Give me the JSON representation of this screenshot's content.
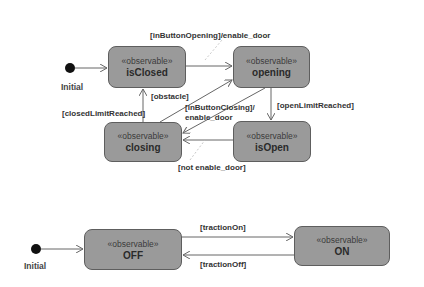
{
  "diagram": {
    "type": "uml-state-machine",
    "machines": [
      {
        "name": "door",
        "initial_label": "Initial",
        "states": [
          {
            "id": "isClosed",
            "stereotype": "«observable»",
            "name": "isClosed"
          },
          {
            "id": "opening",
            "stereotype": "«observable»",
            "name": "opening"
          },
          {
            "id": "closing",
            "stereotype": "«observable»",
            "name": "closing"
          },
          {
            "id": "isOpen",
            "stereotype": "«observable»",
            "name": "isOpen"
          }
        ],
        "transitions": [
          {
            "from": "Initial",
            "to": "isClosed",
            "label": ""
          },
          {
            "from": "isClosed",
            "to": "opening",
            "label": "[inButtonOpening]/enable_door"
          },
          {
            "from": "opening",
            "to": "isOpen",
            "label": "[openLimitReached]"
          },
          {
            "from": "closing",
            "to": "isClosed",
            "label": "[closedLimitReached]"
          },
          {
            "from": "closing",
            "to": "opening",
            "label": "[obstacle]"
          },
          {
            "from": "opening",
            "to": "closing",
            "label": "[inButtonClosing]/",
            "label2": "enable_door"
          },
          {
            "from": "isOpen",
            "to": "closing",
            "label": "[not enable_door]"
          }
        ]
      },
      {
        "name": "traction",
        "initial_label": "Initial",
        "states": [
          {
            "id": "OFF",
            "stereotype": "«observable»",
            "name": "OFF"
          },
          {
            "id": "ON",
            "stereotype": "«observable»",
            "name": "ON"
          }
        ],
        "transitions": [
          {
            "from": "Initial",
            "to": "OFF",
            "label": ""
          },
          {
            "from": "OFF",
            "to": "ON",
            "label": "[tractionOn]"
          },
          {
            "from": "ON",
            "to": "OFF",
            "label": "[tractionOff]"
          }
        ]
      }
    ],
    "colors": {
      "state_fill": "#9a9a9a",
      "state_border": "#5e5e5e",
      "edge": "#666666",
      "background": "#ffffff"
    }
  }
}
